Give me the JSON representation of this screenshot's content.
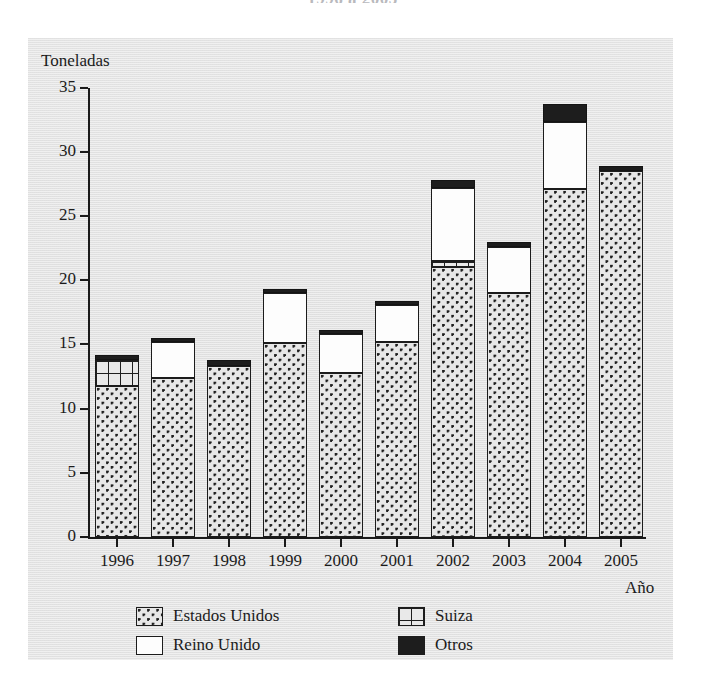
{
  "title_cutoff": "1996 a 2005",
  "axes": {
    "y_title": "Toneladas",
    "x_title": "Año",
    "y_ticks": [
      "0",
      "5",
      "10",
      "15",
      "20",
      "25",
      "30",
      "35"
    ],
    "x_ticks": [
      "1996",
      "1997",
      "1998",
      "1999",
      "2000",
      "2001",
      "2002",
      "2003",
      "2004",
      "2005"
    ]
  },
  "legend": {
    "items": [
      {
        "label": "Estados Unidos",
        "pattern": "dotted",
        "color": "#e7e7e7"
      },
      {
        "label": "Suiza",
        "pattern": "grid",
        "color": "#e9e9e9"
      },
      {
        "label": "Reino Unido",
        "pattern": "solid",
        "color": "#fdfdfd"
      },
      {
        "label": "Otros",
        "pattern": "solid",
        "color": "#1d1d1d"
      }
    ]
  },
  "chart_data": {
    "type": "bar",
    "subtype": "stacked",
    "title": "1996 a 2005",
    "xlabel": "Año",
    "ylabel": "Toneladas",
    "ylim": [
      0,
      35
    ],
    "ytick_step": 5,
    "grid": false,
    "legend_position": "bottom",
    "categories": [
      "1996",
      "1997",
      "1998",
      "1999",
      "2000",
      "2001",
      "2002",
      "2003",
      "2004",
      "2005"
    ],
    "series": [
      {
        "name": "Estados Unidos",
        "values": [
          11.8,
          12.4,
          13.3,
          15.1,
          12.8,
          15.2,
          21.0,
          19.0,
          27.1,
          28.5
        ]
      },
      {
        "name": "Suiza",
        "values": [
          2.0,
          0.0,
          0.0,
          0.0,
          0.0,
          0.0,
          0.5,
          0.0,
          0.0,
          0.0
        ]
      },
      {
        "name": "Reino Unido",
        "values": [
          0.0,
          2.8,
          0.0,
          3.9,
          3.0,
          2.9,
          5.7,
          3.6,
          5.2,
          0.0
        ]
      },
      {
        "name": "Otros",
        "values": [
          0.4,
          0.3,
          0.5,
          0.3,
          0.3,
          0.3,
          0.6,
          0.4,
          1.4,
          0.4
        ]
      }
    ],
    "totals": [
      14.2,
      15.5,
      13.8,
      19.3,
      16.1,
      18.4,
      27.8,
      23.0,
      33.7,
      28.9
    ]
  },
  "render": {
    "y0_px": 537,
    "px_per_unit": 12.84,
    "bar_width_px": 44,
    "bar_left_px": [
      95,
      151,
      207,
      263,
      319,
      375,
      431,
      487,
      543,
      599
    ]
  }
}
